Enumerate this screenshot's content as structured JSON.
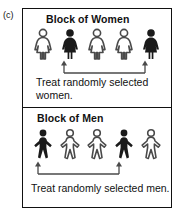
{
  "figure": {
    "panel_label": "(c)",
    "border_color": "#111111",
    "background_color": "#ffffff",
    "filled_figure_color": "#1a1a1a",
    "outline_figure_color": "#4a4a4a",
    "arrow_color": "#4a4a4a"
  },
  "blocks": [
    {
      "id": "block-women",
      "title": "Block of Women",
      "figure_type": "woman",
      "count": 5,
      "people": [
        {
          "index": 1,
          "selected": false
        },
        {
          "index": 2,
          "selected": true
        },
        {
          "index": 3,
          "selected": false
        },
        {
          "index": 4,
          "selected": false
        },
        {
          "index": 5,
          "selected": true
        }
      ],
      "selected_indices": [
        2,
        5
      ],
      "caption_lines": [
        "Treat randomly selected",
        "women."
      ],
      "caption_full": "Treat randomly selected women."
    },
    {
      "id": "block-men",
      "title": "Block of Men",
      "figure_type": "man",
      "count": 5,
      "people": [
        {
          "index": 1,
          "selected": true
        },
        {
          "index": 2,
          "selected": false
        },
        {
          "index": 3,
          "selected": false
        },
        {
          "index": 4,
          "selected": true
        },
        {
          "index": 5,
          "selected": false
        }
      ],
      "selected_indices": [
        1,
        4
      ],
      "caption_lines": [
        "Treat randomly selected men."
      ],
      "caption_full": "Treat randomly selected men."
    }
  ]
}
